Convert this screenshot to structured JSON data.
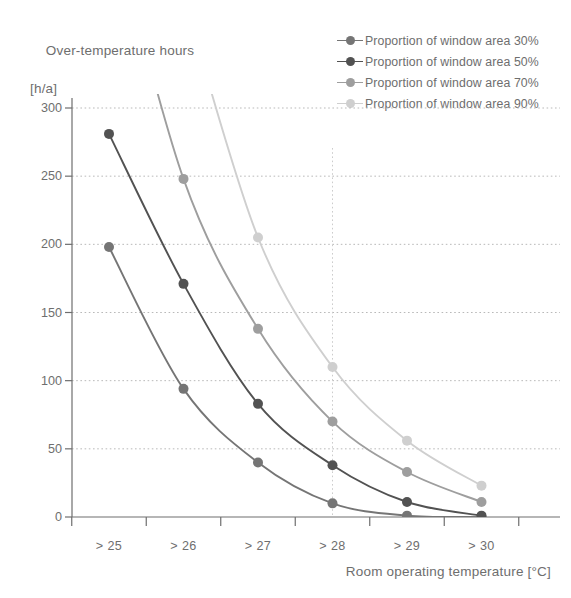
{
  "chart_data": {
    "type": "line",
    "title": "",
    "ylabel_line1": "Over-temperature hours",
    "ylabel_line2": "[h/a]",
    "xlabel": "Room operating temperature [°C]",
    "categories": [
      "> 25",
      "> 26",
      "> 27",
      "> 28",
      "> 29",
      "> 30"
    ],
    "ylim": [
      0,
      300
    ],
    "yticks": [
      0,
      50,
      100,
      150,
      200,
      250,
      300
    ],
    "ytick_labels": [
      "0",
      "50",
      "100",
      "150",
      "200",
      "250",
      "300"
    ],
    "grid": "horizontal-dotted",
    "legend_position": "top-right",
    "annotations": [
      {
        "type": "vertical-reference-line",
        "at_category": "> 28",
        "style": "dotted"
      }
    ],
    "series": [
      {
        "name": "Proportion of window area 30%",
        "color": "#757575",
        "values": [
          198,
          94,
          40,
          10,
          1,
          0
        ],
        "markers_visible": [
          true,
          true,
          true,
          true,
          true,
          true
        ]
      },
      {
        "name": "Proportion of window area 50%",
        "color": "#525252",
        "values": [
          281,
          171,
          83,
          38,
          11,
          1
        ],
        "markers_visible": [
          true,
          true,
          true,
          true,
          true,
          true
        ]
      },
      {
        "name": "Proportion of window area 70%",
        "color": "#9e9e9e",
        "values": [
          null,
          248,
          138,
          70,
          33,
          11
        ],
        "markers_visible": [
          false,
          true,
          true,
          true,
          true,
          true
        ],
        "offscreen_note": "enters plot above 300 between > 25 and > 26"
      },
      {
        "name": "Proportion of window area 90%",
        "color": "#cfcfcf",
        "values": [
          null,
          null,
          205,
          110,
          56,
          23
        ],
        "markers_visible": [
          false,
          false,
          true,
          true,
          true,
          true
        ],
        "offscreen_note": "enters plot above 300 between > 25 and > 26"
      }
    ]
  },
  "legend": {
    "items": [
      {
        "label": "Proportion of window area 30%",
        "color": "#757575"
      },
      {
        "label": "Proportion of window area 50%",
        "color": "#525252"
      },
      {
        "label": "Proportion of window area 70%",
        "color": "#9e9e9e"
      },
      {
        "label": "Proportion of window area 90%",
        "color": "#cfcfcf"
      }
    ]
  },
  "axes": {
    "y_title_line1": "Over-temperature hours",
    "y_title_line2": "[h/a]",
    "x_title": "Room operating temperature [°C]",
    "y_tick_labels": [
      "300",
      "250",
      "200",
      "150",
      "100",
      "50",
      "0"
    ],
    "x_tick_labels": [
      "> 25",
      "> 26",
      "> 27",
      "> 28",
      "> 29",
      "> 30"
    ]
  },
  "colors": {
    "axis": "#6e6e6e",
    "grid": "#b9b9b9",
    "text": "#6e6e6e",
    "background": "#ffffff"
  }
}
